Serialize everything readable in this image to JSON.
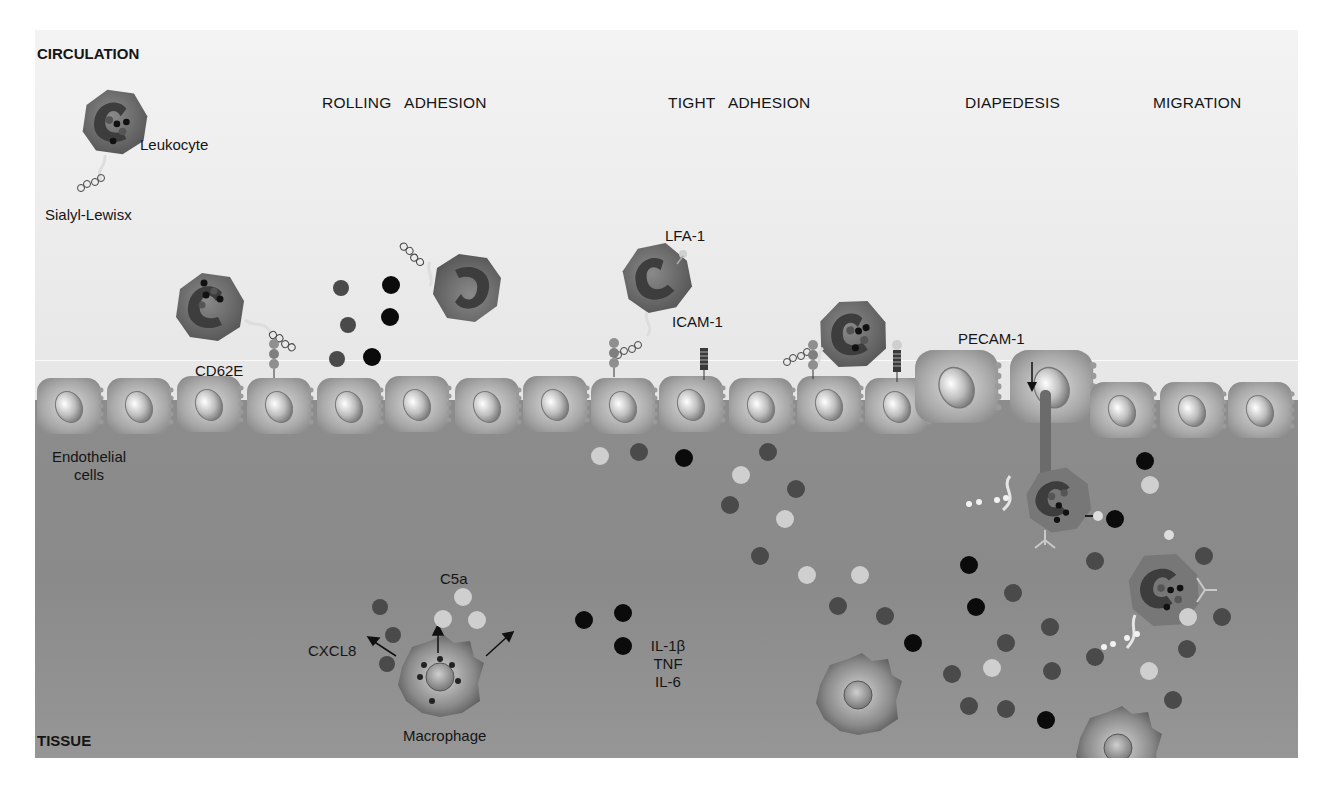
{
  "figure": {
    "regions": {
      "top": "CIRCULATION",
      "bottom": "TISSUE"
    },
    "stages": [
      {
        "id": "rolling",
        "label": "ROLLING   ADHESION"
      },
      {
        "id": "tight",
        "label": "TIGHT   ADHESION"
      },
      {
        "id": "diapedesis",
        "label": "DIAPEDESIS"
      },
      {
        "id": "migration",
        "label": "MIGRATION"
      }
    ],
    "labels": {
      "leukocyte": "Leukocyte",
      "sialyl_lewis": "Sialyl-Lewisx",
      "cd62e": "CD62E",
      "lfa1": "LFA-1",
      "icam1": "ICAM-1",
      "pecam1": "PECAM-1",
      "endothelial_line1": "Endothelial",
      "endothelial_line2": "cells",
      "c5a": "C5a",
      "cxcl8": "CXCL8",
      "cytokine_1": "IL-1β",
      "cytokine_2": "TNF",
      "cytokine_3": "IL-6",
      "macrophage": "Macrophage"
    },
    "colors": {
      "circulation_bg": "#efefef",
      "tissue_bg": "#8c8c8c",
      "cell_body": "#6e6e6e",
      "nucleus": "#3f3f3f",
      "chemokine_dark": "#4a4a4a",
      "cytokine_black": "#0b0b0b",
      "c5a_light": "#cfcfcf",
      "endothelium": "#b8b8b8"
    },
    "legend_molecules": [
      {
        "name": "CXCL8",
        "shade": "dark gray"
      },
      {
        "name": "C5a",
        "shade": "light gray"
      },
      {
        "name": "IL-1β / TNF / IL-6",
        "shade": "black"
      }
    ]
  }
}
